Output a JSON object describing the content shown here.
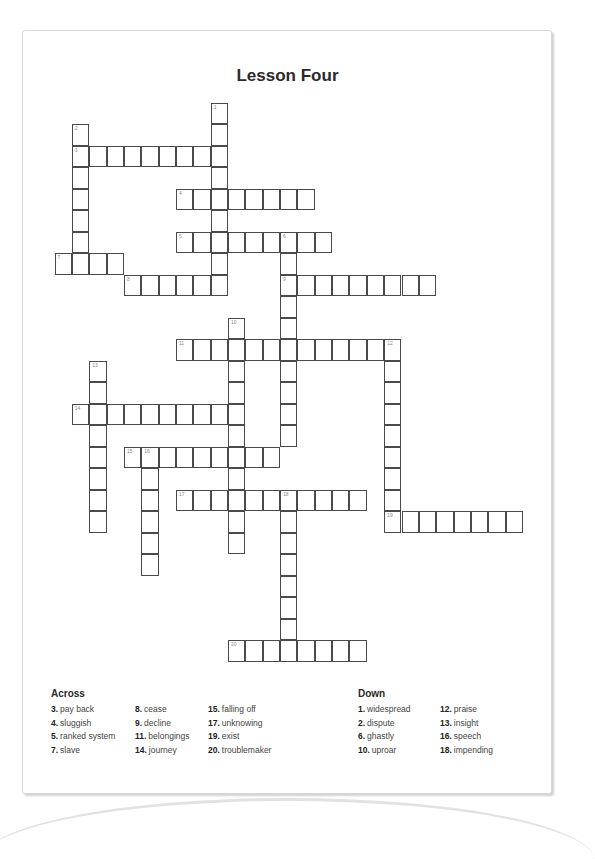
{
  "title": "Lesson Four",
  "grid": {
    "origin_x": 55,
    "origin_y": 103,
    "cell_w": 17.35,
    "cell_h": 21.5,
    "words": [
      {
        "num": 1,
        "dir": "down",
        "col": 9,
        "row": 0,
        "len": 9
      },
      {
        "num": 2,
        "dir": "down",
        "col": 1,
        "row": 1,
        "len": 7
      },
      {
        "num": 3,
        "dir": "across",
        "col": 1,
        "row": 2,
        "len": 9
      },
      {
        "num": 4,
        "dir": "across",
        "col": 7,
        "row": 4,
        "len": 8
      },
      {
        "num": 5,
        "dir": "across",
        "col": 7,
        "row": 6,
        "len": 9
      },
      {
        "num": 6,
        "dir": "down",
        "col": 13,
        "row": 6,
        "len": 10
      },
      {
        "num": 7,
        "dir": "across",
        "col": 0,
        "row": 7,
        "len": 4
      },
      {
        "num": 8,
        "dir": "across",
        "col": 4,
        "row": 8,
        "len": 6
      },
      {
        "num": 9,
        "dir": "across",
        "col": 13,
        "row": 8,
        "len": 9
      },
      {
        "num": 10,
        "dir": "down",
        "col": 10,
        "row": 10,
        "len": 11
      },
      {
        "num": 11,
        "dir": "across",
        "col": 7,
        "row": 11,
        "len": 13
      },
      {
        "num": 12,
        "dir": "down",
        "col": 19,
        "row": 11,
        "len": 9
      },
      {
        "num": 13,
        "dir": "down",
        "col": 2,
        "row": 12,
        "len": 8
      },
      {
        "num": 14,
        "dir": "across",
        "col": 1,
        "row": 14,
        "len": 10
      },
      {
        "num": 15,
        "dir": "across",
        "col": 4,
        "row": 16,
        "len": 9
      },
      {
        "num": 16,
        "dir": "down",
        "col": 5,
        "row": 16,
        "len": 6
      },
      {
        "num": 17,
        "dir": "across",
        "col": 7,
        "row": 18,
        "len": 11
      },
      {
        "num": 18,
        "dir": "down",
        "col": 13,
        "row": 18,
        "len": 8
      },
      {
        "num": 19,
        "dir": "across",
        "col": 19,
        "row": 19,
        "len": 8
      },
      {
        "num": 20,
        "dir": "across",
        "col": 10,
        "row": 25,
        "len": 8
      }
    ]
  },
  "clues": {
    "across_heading": "Across",
    "down_heading": "Down",
    "across": [
      [
        {
          "n": "3.",
          "t": "pay back"
        },
        {
          "n": "4.",
          "t": "sluggish"
        },
        {
          "n": "5.",
          "t": "ranked system"
        },
        {
          "n": "7.",
          "t": "slave"
        }
      ],
      [
        {
          "n": "8.",
          "t": "cease"
        },
        {
          "n": "9.",
          "t": "decline"
        },
        {
          "n": "11.",
          "t": "belongings"
        },
        {
          "n": "14.",
          "t": "journey"
        }
      ],
      [
        {
          "n": "15.",
          "t": "falling off"
        },
        {
          "n": "17.",
          "t": "unknowing"
        },
        {
          "n": "19.",
          "t": "exist"
        },
        {
          "n": "20.",
          "t": "troublemaker"
        }
      ]
    ],
    "down": [
      [
        {
          "n": "1.",
          "t": "widespread"
        },
        {
          "n": "2.",
          "t": "dispute"
        },
        {
          "n": "6.",
          "t": "ghastly"
        },
        {
          "n": "10.",
          "t": "uproar"
        }
      ],
      [
        {
          "n": "12.",
          "t": "praise"
        },
        {
          "n": "13.",
          "t": "insight"
        },
        {
          "n": "16.",
          "t": "speech"
        },
        {
          "n": "18.",
          "t": "impending"
        }
      ]
    ]
  }
}
